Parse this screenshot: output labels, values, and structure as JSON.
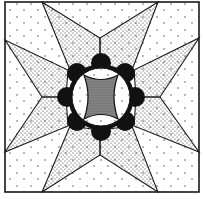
{
  "illustration": {
    "subject": "quilt-block-eight-point-star-with-wedding-ring-center",
    "colors": {
      "background": "#ffffff",
      "line": "#1a1a1a",
      "ring": "#111111",
      "light_dots": "#3a3a3a",
      "star_dots": "#2a2a2a",
      "center_fill": "#6a6a6a"
    },
    "frame": {
      "x": 5,
      "y": 2,
      "width": 194,
      "height": 190
    },
    "star_tips": [
      [
        42,
        2
      ],
      [
        158,
        2
      ],
      [
        199,
        38
      ],
      [
        199,
        152
      ],
      [
        158,
        192
      ],
      [
        42,
        192
      ],
      [
        5,
        152
      ],
      [
        5,
        40
      ]
    ],
    "star_inner_points": [
      [
        100,
        38
      ],
      [
        160,
        97
      ],
      [
        100,
        155
      ],
      [
        42,
        97
      ]
    ],
    "center": {
      "cx": 101,
      "cy": 97,
      "ring_radius": 35,
      "scallops": 8
    }
  }
}
